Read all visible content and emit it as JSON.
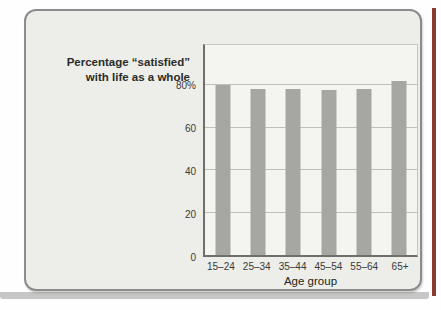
{
  "figure": {
    "title_line1": "Percentage “satisfied”",
    "title_line2": "with life as a whole",
    "xlabel": "Age group"
  },
  "chart_data": {
    "type": "bar",
    "title": "Percentage “satisfied” with life as a whole",
    "categories": [
      "15–24",
      "25–34",
      "35–44",
      "45–54",
      "55–64",
      "65+"
    ],
    "values": [
      80,
      78.5,
      78.5,
      78,
      78.5,
      82
    ],
    "xlabel": "Age group",
    "ylabel": "",
    "ylim": [
      0,
      99
    ],
    "yticks": [
      {
        "value": 0,
        "label": "0"
      },
      {
        "value": 20,
        "label": "20"
      },
      {
        "value": 40,
        "label": "40"
      },
      {
        "value": 60,
        "label": "60"
      },
      {
        "value": 80,
        "label": "80%"
      }
    ],
    "grid": true,
    "legend": false,
    "bar_color": "#a6a7a3"
  },
  "colors": {
    "card_background": "#edeee9",
    "card_border": "#8b8d8c",
    "plot_background": "#f4f4f0",
    "grid_line": "#c0c0ba",
    "axis_line": "#6e6e6a",
    "bar_fill": "#a6a7a3",
    "text": "#2e2e2c",
    "page_edge_accent": "#8a3a33",
    "shadow_band": "#c6c6c4"
  }
}
